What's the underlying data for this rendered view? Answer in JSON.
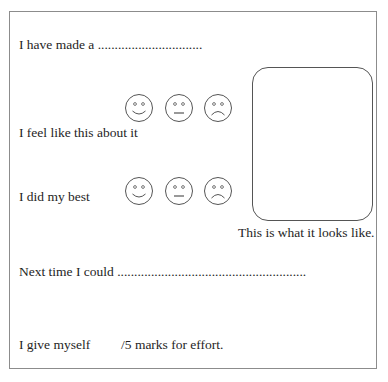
{
  "worksheet": {
    "line1": {
      "label": "I have made a",
      "blank": "..............................."
    },
    "feel": {
      "label": "I feel like this about it"
    },
    "best": {
      "label": "I did my best"
    },
    "faces": [
      "happy-face",
      "neutral-face",
      "sad-face"
    ],
    "picture_caption": "This is what it looks like.",
    "next": {
      "label": "Next time I could",
      "blank": "........................................................"
    },
    "marks": {
      "label": "I give myself",
      "suffix": "/5 marks for effort."
    }
  }
}
